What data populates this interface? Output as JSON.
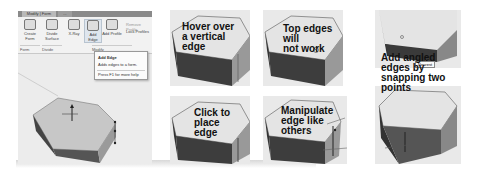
{
  "ribbon": {
    "tabs": [
      {
        "label": "Modify | Form"
      },
      {
        "label": "..."
      }
    ],
    "buttons": [
      {
        "label": "Create Form"
      },
      {
        "label": "Divide Surface"
      },
      {
        "label": "X-Ray"
      },
      {
        "label": "Add Edge"
      },
      {
        "label": "Add Profile"
      }
    ],
    "small_buttons": [
      {
        "label": "Remove Profile"
      },
      {
        "label": "Lock Profiles"
      }
    ],
    "groups": [
      {
        "label": "Form"
      },
      {
        "label": "Divide"
      },
      {
        "label": "Modify"
      }
    ]
  },
  "tooltip": {
    "title": "Add Edge",
    "description": "Adds edges to a form.",
    "help": "Press F1 for more help"
  },
  "panels": [
    {
      "caption": "Hover over a vertical edge",
      "lines": [
        "Hover over",
        "a vertical",
        "edge"
      ]
    },
    {
      "caption": "Top edges will not work",
      "lines": [
        "Top edges",
        "will",
        "not work"
      ],
      "icon": "no-symbol-icon"
    },
    {
      "caption": "Click to place edge",
      "lines": [
        "Click to",
        "place",
        "edge"
      ]
    },
    {
      "caption": "Manipulate edge like others",
      "lines": [
        "Manipulate",
        "edge like",
        "others"
      ]
    },
    {
      "caption": "Add angled edges by snapping two points",
      "lines": [
        "Add angled",
        "edges by",
        "snapping two",
        "points"
      ],
      "snap_label": "Nearest"
    }
  ]
}
